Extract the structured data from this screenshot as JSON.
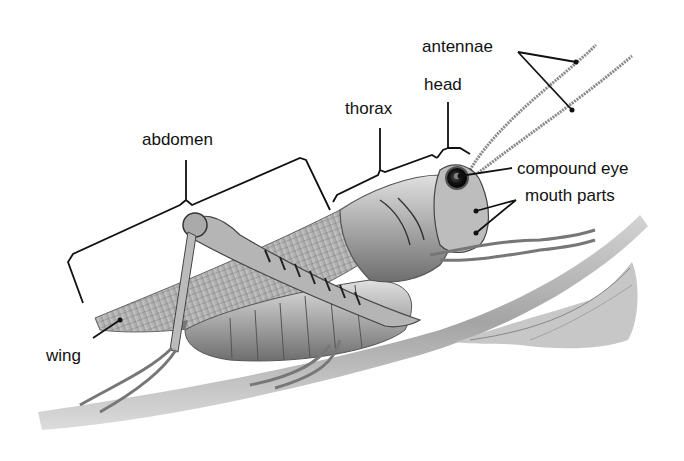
{
  "diagram": {
    "type": "labeled anatomy illustration",
    "labels": {
      "antennae": "antennae",
      "head": "head",
      "thorax": "thorax",
      "abdomen": "abdomen",
      "compound_eye": "compound eye",
      "mouth_parts": "mouth parts",
      "wing": "wing"
    },
    "colors": {
      "background": "#ffffff",
      "label_text": "#111111",
      "leader_lines": "#111111",
      "illustration_dark": "#3a3a3a",
      "illustration_mid": "#8a8a8a",
      "illustration_light": "#d6d6d6"
    }
  }
}
